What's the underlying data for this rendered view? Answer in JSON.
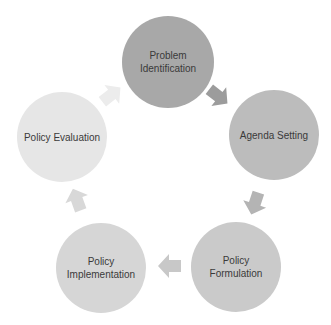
{
  "diagram": {
    "type": "cycle",
    "nodes": [
      {
        "id": "problem-identification",
        "lines": [
          "Problem",
          "Identification"
        ],
        "cx": 168,
        "cy": 62,
        "r": 46,
        "color": "#a8a8a8"
      },
      {
        "id": "agenda-setting",
        "lines": [
          "Agenda Setting"
        ],
        "cx": 274,
        "cy": 135,
        "r": 45,
        "color": "#bcbcbc"
      },
      {
        "id": "policy-formulation",
        "lines": [
          "Policy",
          "Formulation"
        ],
        "cx": 236,
        "cy": 267,
        "r": 45,
        "color": "#cacaca"
      },
      {
        "id": "policy-implementation",
        "lines": [
          "Policy",
          "Implementation"
        ],
        "cx": 101,
        "cy": 268,
        "r": 45,
        "color": "#d6d6d6"
      },
      {
        "id": "policy-evaluation",
        "lines": [
          "Policy Evaluation"
        ],
        "cx": 62,
        "cy": 137,
        "r": 45,
        "color": "#e6e6e6"
      }
    ],
    "arrows": [
      {
        "from": "problem-identification",
        "to": "agenda-setting",
        "x": 218,
        "y": 96,
        "angle": 38,
        "color": "#9c9c9c"
      },
      {
        "from": "agenda-setting",
        "to": "policy-formulation",
        "x": 255,
        "y": 203,
        "angle": 108,
        "color": "#b4b4b4"
      },
      {
        "from": "policy-formulation",
        "to": "policy-implementation",
        "x": 170,
        "y": 266,
        "angle": 180,
        "color": "#c8c8c8"
      },
      {
        "from": "policy-implementation",
        "to": "policy-evaluation",
        "x": 77,
        "y": 200,
        "angle": 250,
        "color": "#d8d8d8"
      },
      {
        "from": "policy-evaluation",
        "to": "problem-identification",
        "x": 111,
        "y": 95,
        "angle": 322,
        "color": "#ececec"
      }
    ]
  }
}
